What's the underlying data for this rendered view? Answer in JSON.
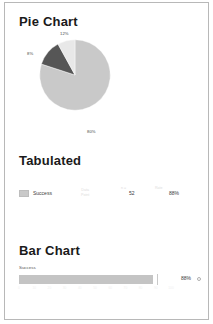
{
  "panel": {
    "border_color": "#b8b8b8",
    "background": "#ffffff"
  },
  "pie_section": {
    "title": "Pie Chart"
  },
  "tabulated_section": {
    "title": "Tabulated",
    "row": {
      "swatch_color": "#c9c9c9",
      "name": "Success",
      "faint_a": "Data",
      "faint_a2": "Point",
      "faint_b": "n =",
      "count": "52",
      "faint_c": "Rate",
      "percent": "88%"
    }
  },
  "bar_section": {
    "title": "Bar Chart",
    "series_label": "Success",
    "value_label": "88%",
    "circle_icon": "circle-icon"
  },
  "chart_data": [
    {
      "type": "pie",
      "title": "Pie Chart",
      "categories": [
        "Success",
        "Partial",
        "Failure"
      ],
      "values": [
        80,
        12,
        8
      ],
      "labels": [
        "80%",
        "12%",
        "8%"
      ],
      "colors": [
        "#c9c9c9",
        "#565656",
        "#e8e8e8"
      ],
      "legend": "none",
      "start_angle_deg": -90
    },
    {
      "type": "table",
      "title": "Tabulated",
      "columns": [
        "Series",
        "Data Point",
        "n =",
        "Count",
        "Rate",
        "Percent"
      ],
      "rows": [
        [
          "Success",
          "Data Point",
          "n =",
          "52",
          "Rate",
          "88%"
        ]
      ]
    },
    {
      "type": "bar",
      "title": "Bar Chart",
      "orientation": "horizontal",
      "categories": [
        "Success"
      ],
      "values": [
        88
      ],
      "value_labels": [
        "88%"
      ],
      "xlabel": "",
      "ylabel": "",
      "xlim": [
        0,
        100
      ],
      "xticks": [
        0,
        10,
        20,
        30,
        40,
        50,
        60,
        70,
        80,
        90,
        100
      ],
      "grid": false,
      "legend": "none",
      "bar_color": "#c4c4c4"
    }
  ]
}
